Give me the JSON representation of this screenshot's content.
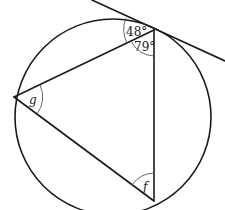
{
  "diagram": {
    "type": "circle-geometry",
    "colors": {
      "stroke": "#1a1a1a",
      "arc": "#555555",
      "background": "#ffffff"
    },
    "circle": {
      "cx": 113,
      "cy": 117,
      "r": 98
    },
    "points": {
      "top": {
        "x": 154,
        "y": 30
      },
      "left": {
        "x": 14,
        "y": 97
      },
      "bottom": {
        "x": 154,
        "y": 201
      }
    },
    "tangent": {
      "x1": 92,
      "y1": 0,
      "x2": 225,
      "y2": 61
    },
    "labels": {
      "angle_tangent_chord": "48°",
      "angle_top_vertex": "79°",
      "angle_left_vertex": "g",
      "angle_bottom_vertex": "f"
    }
  }
}
